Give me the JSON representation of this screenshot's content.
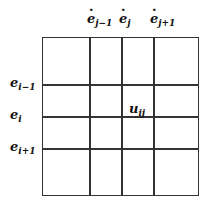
{
  "diagram": {
    "type": "matrix-grid",
    "rows": 4,
    "cols": 4,
    "column_labels": [
      {
        "base": "e",
        "sub": "j−1",
        "dotted": true
      },
      {
        "base": "e",
        "sub": "j",
        "dotted": true
      },
      {
        "base": "e",
        "sub": "j+1",
        "dotted": true
      }
    ],
    "row_labels": [
      {
        "base": "e",
        "sub": "i−1"
      },
      {
        "base": "e",
        "sub": "i"
      },
      {
        "base": "e",
        "sub": "i+1"
      }
    ],
    "cell_label": {
      "base": "u",
      "sub": "ij",
      "row": 1,
      "col": 2
    }
  }
}
